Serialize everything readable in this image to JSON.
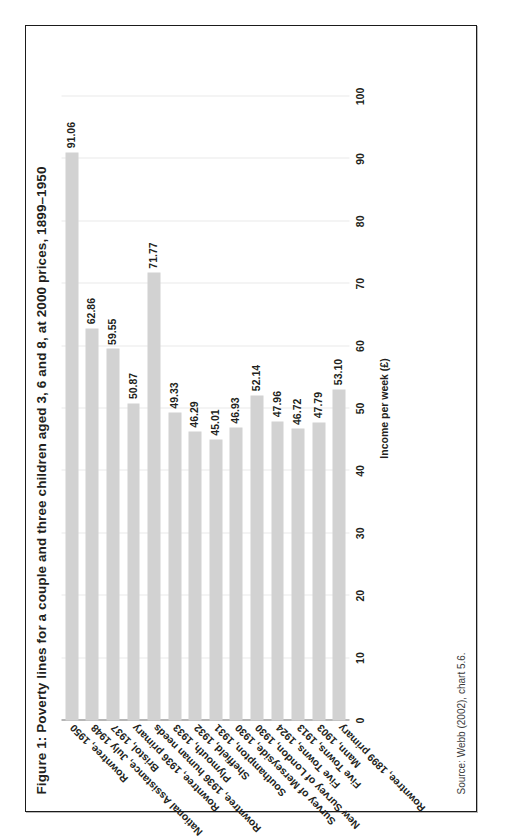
{
  "figure": {
    "title": "Figure 1: Poverty lines for a couple and three children aged 3, 6 and 8, at 2000 prices, 1899–1950",
    "source": "Source: Webb (2002), chart 5.6.",
    "orientation": "rotated-90-ccw",
    "bar_color": "#d2d2d2",
    "gridline_color": "#e9e9e9",
    "axis_color": "#6f6f6f",
    "frame_color": "#1b1b1b"
  },
  "chart_data": {
    "type": "bar",
    "title": "Figure 1: Poverty lines for a couple and three children aged 3, 6 and 8, at 2000 prices, 1899–1950",
    "xlabel": "",
    "ylabel": "Income per week (£)",
    "ylim": [
      0,
      100
    ],
    "ytick_step": 10,
    "yticks": [
      0,
      10,
      20,
      30,
      40,
      50,
      60,
      70,
      80,
      90,
      100
    ],
    "ytick_labels": [
      "0",
      "10",
      "20",
      "30",
      "40",
      "50",
      "60",
      "70",
      "80",
      "90",
      "100"
    ],
    "grid": true,
    "legend": false,
    "categories": [
      "Rowntree, 1899 primary",
      "Mann, 1903",
      "Five Towns, 1913",
      "Five Towns, 1924",
      "New Survey of London, 1930",
      "Survey of Merseyside, 1930",
      "Southampton, 1931",
      "Sheffield, 1932",
      "Plymouth, 1933",
      "Rowntree, 1936 human needs",
      "Rowntree, 1936 primary",
      "Bristol, 1937",
      "National Assistance, July 1948",
      "Rowntree, 1950"
    ],
    "values": [
      53.1,
      47.79,
      46.72,
      47.96,
      52.14,
      46.93,
      45.01,
      46.29,
      49.33,
      71.77,
      50.87,
      59.55,
      62.86,
      91.06
    ],
    "value_labels": [
      "53.10",
      "47.79",
      "46.72",
      "47.96",
      "52.14",
      "46.93",
      "45.01",
      "46.29",
      "49.33",
      "71.77",
      "50.87",
      "59.55",
      "62.86",
      "91.06"
    ]
  }
}
